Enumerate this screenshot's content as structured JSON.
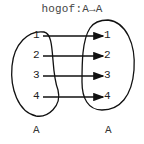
{
  "title": "hogof:A→A",
  "domain": {
    "name": "A",
    "elements": [
      "1",
      "2",
      "3",
      "4"
    ]
  },
  "codomain": {
    "name": "A",
    "elements": [
      "1",
      "2",
      "3",
      "4"
    ]
  },
  "mapping": [
    {
      "from": "1",
      "to": "1"
    },
    {
      "from": "2",
      "to": "2"
    },
    {
      "from": "3",
      "to": "3"
    },
    {
      "from": "4",
      "to": "4"
    }
  ]
}
